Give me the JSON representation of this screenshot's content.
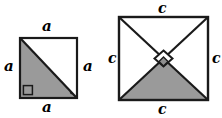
{
  "diagram": {
    "background_color": "#ffffff",
    "stroke_color": "#1a1a1a",
    "shade_color": "#9a9a9a",
    "figures": [
      {
        "id": "square-a",
        "name": "square-with-diagonal",
        "description": "Square with one diagonal; lower-left triangle shaded; right angle marked at bottom-left corner",
        "side_symbol": "a",
        "labels": {
          "top": "a",
          "left": "a",
          "right": "a",
          "bottom": "a"
        },
        "markers": {
          "right_angle": "square-corner-marker",
          "tick": "small-tick-mark"
        }
      },
      {
        "id": "square-c",
        "name": "square-with-both-diagonals",
        "description": "Square with both diagonals; bottom triangle shaded; right angle marked at the center intersection with a diamond",
        "side_symbol": "c",
        "labels": {
          "top": "c",
          "left": "c",
          "right": "c",
          "bottom": "c"
        },
        "markers": {
          "right_angle": "diamond-center-marker"
        }
      }
    ]
  }
}
